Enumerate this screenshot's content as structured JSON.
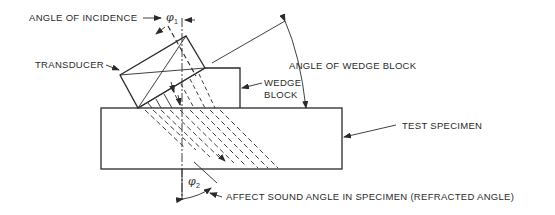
{
  "diagram": {
    "labels": {
      "angle_of_incidence": "ANGLE OF INCIDENCE",
      "phi1": "φ",
      "phi1_sub": "1",
      "transducer": "TRANSDUCER",
      "angle_of_wedge_block": "ANGLE OF WEDGE BLOCK",
      "wedge_block_line1": "WEDGE",
      "wedge_block_line2": "BLOCK",
      "test_specimen": "TEST SPECIMEN",
      "phi2": "φ",
      "phi2_sub": "2",
      "refracted_angle": "AFFECT SOUND ANGLE IN SPECIMEN (REFRACTED ANGLE)"
    },
    "colors": {
      "ink": "#2a2a2a",
      "background": "#ffffff"
    }
  }
}
